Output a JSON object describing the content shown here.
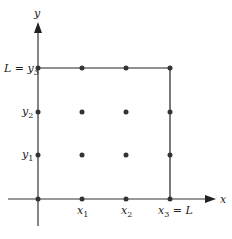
{
  "diagram": {
    "axes": {
      "x_label": "x",
      "y_label": "y",
      "color": "#333333"
    },
    "box": {
      "top_label": {
        "lhs": "L",
        "eq": " = ",
        "var": "y",
        "sub": "3"
      },
      "right_label": {
        "var": "x",
        "sub": "3",
        "eq": " = ",
        "rhs": "L"
      },
      "color": "#222222"
    },
    "x_ticks": [
      {
        "var": "x",
        "sub": "1"
      },
      {
        "var": "x",
        "sub": "2"
      }
    ],
    "y_ticks": [
      {
        "var": "y",
        "sub": "1"
      },
      {
        "var": "y",
        "sub": "2"
      }
    ],
    "grid_points": {
      "columns": 4,
      "rows": 4,
      "color": "#333333",
      "description": "4x4 grid of nodes at x0..x3, y0..y3"
    }
  }
}
